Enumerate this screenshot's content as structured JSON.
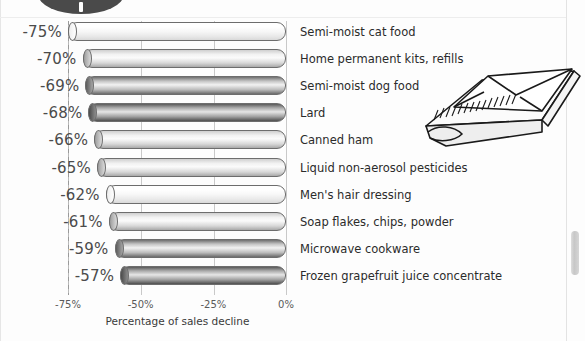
{
  "chart_data": {
    "type": "bar",
    "orientation": "horizontal",
    "title": "",
    "xlabel": "Percentage of sales decline",
    "ylabel": "",
    "xlim": [
      -75,
      0
    ],
    "grid": true,
    "legend": "none",
    "xticks": [
      "-75%",
      "-50%",
      "-25%",
      "0%"
    ],
    "xtick_values": [
      -75,
      -50,
      -25,
      0
    ],
    "categories": [
      "Semi-moist cat food",
      "Home permanent kits, refills",
      "Semi-moist dog food",
      "Lard",
      "Canned ham",
      "Liquid non-aerosol pesticides",
      "Men's hair dressing",
      "Soap flakes, chips, powder",
      "Microwave cookware",
      "Frozen grapefruit juice concentrate"
    ],
    "values": [
      -75,
      -70,
      -69,
      -68,
      -66,
      -65,
      -62,
      -61,
      -59,
      -57
    ],
    "data_labels": [
      "-75%",
      "-70%",
      "-69%",
      "-68%",
      "-66%",
      "-65%",
      "-62%",
      "-61%",
      "-59%",
      "-57%"
    ],
    "bar_shading": [
      "light",
      "mid",
      "dark",
      "darker",
      "mid",
      "mid",
      "light",
      "mid",
      "dark",
      "darker"
    ]
  },
  "axis": {
    "x_title": "Percentage of sales decline"
  },
  "decor": {
    "envelope_icon": "envelope-illustration",
    "top_blob": "dark-ellipse-decoration"
  }
}
